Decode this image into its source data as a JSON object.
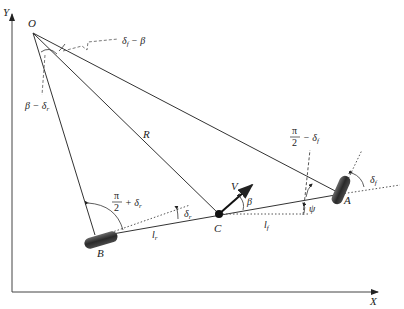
{
  "axes": {
    "x_label": "X",
    "y_label": "Y"
  },
  "points": {
    "O": {
      "label": "O",
      "x": 33,
      "y": 33
    },
    "A": {
      "label": "A",
      "x": 341,
      "y": 194
    },
    "B": {
      "label": "B",
      "x": 101,
      "y": 236
    },
    "C": {
      "label": "C",
      "x": 219,
      "y": 214
    }
  },
  "labels": {
    "R": "R",
    "V": "V",
    "beta": "β",
    "psi": "ψ",
    "lf": "l",
    "lf_sub": "f",
    "lr": "l",
    "lr_sub": "r",
    "delta_f": "δ",
    "delta_f_sub": "f",
    "delta_r": "δ",
    "delta_r_sub": "r",
    "angle_O_top": "δ",
    "angle_O_top_sub": "f",
    "angle_O_top_rest": " − β",
    "angle_O_left": "β − δ",
    "angle_O_left_sub": "r",
    "pi_num": "π",
    "pi_den": "2",
    "front_angle_rest": "− δ",
    "front_angle_sub": "f",
    "rear_angle_rest": "+ δ",
    "rear_angle_sub": "r"
  },
  "colors": {
    "line": "#333333",
    "wheel": "#3a3a3a",
    "dotted": "#555555"
  }
}
